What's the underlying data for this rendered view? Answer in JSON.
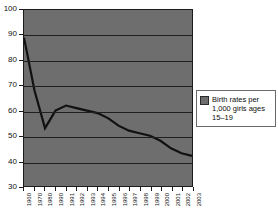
{
  "chart_data": {
    "type": "line",
    "title": "",
    "xlabel": "",
    "ylabel": "",
    "ylim": [
      30,
      100
    ],
    "ytick_values": [
      100,
      90,
      80,
      70,
      60,
      50,
      40,
      30
    ],
    "grid": true,
    "grid_axis": "y",
    "legend_position": "right",
    "plot_background": "#6e6e6e",
    "line_color": "#111111",
    "categories": [
      "1960",
      "1970",
      "1980",
      "1990",
      "1991",
      "1992",
      "1993",
      "1994",
      "1995",
      "1996",
      "1997",
      "1998",
      "1999",
      "2000",
      "2001",
      "2002",
      "2003"
    ],
    "series": [
      {
        "name": "Birth rates per 1,000 girls ages 15–19",
        "values": [
          89,
          68,
          53,
          60,
          62,
          61,
          60,
          59,
          57,
          54,
          52,
          51,
          50,
          48,
          45,
          43,
          42
        ]
      }
    ]
  },
  "legend": {
    "label_line1": "Birth rates per",
    "label_line2": "1,000 girls ages",
    "label_line3": "15–19",
    "swatch_color": "#6e6e6e"
  },
  "caption": {
    "text": ""
  }
}
